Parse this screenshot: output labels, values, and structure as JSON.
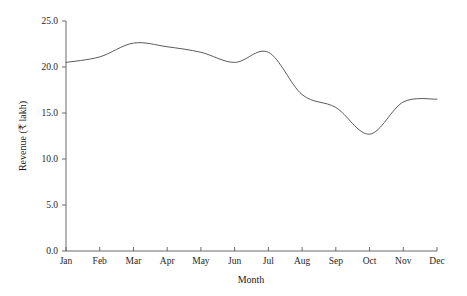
{
  "chart_data": {
    "type": "line",
    "title": "",
    "subtitle": "",
    "xlabel": "Month",
    "ylabel": "Revenue (₹ lakh)",
    "categories": [
      "Jan",
      "Feb",
      "Mar",
      "Apr",
      "May",
      "Jun",
      "Jul",
      "Aug",
      "Sep",
      "Oct",
      "Nov",
      "Dec"
    ],
    "values": [
      20.5,
      21.1,
      22.6,
      22.2,
      21.6,
      20.5,
      21.6,
      17.0,
      15.6,
      12.7,
      16.2,
      16.5
    ],
    "series": [
      {
        "name": "Revenue",
        "values": [
          20.5,
          21.1,
          22.6,
          22.2,
          21.6,
          20.5,
          21.6,
          17.0,
          15.6,
          12.7,
          16.2,
          16.5
        ],
        "color": "#5a5a5a"
      }
    ],
    "ylim": [
      0.0,
      25.0
    ],
    "ytick_values": [
      0.0,
      5.0,
      10.0,
      15.0,
      20.0,
      25.0
    ],
    "ytick_labels": [
      "0.0",
      "5.0",
      "10.0",
      "15.0",
      "20.0",
      "25.0"
    ],
    "xtick_labels": [
      "Jan",
      "Feb",
      "Mar",
      "Apr",
      "May",
      "Jun",
      "Jul",
      "Aug",
      "Sep",
      "Oct",
      "Nov",
      "Dec"
    ],
    "grid": false,
    "legend": false,
    "legend_position": "none",
    "smoothing": "spline",
    "line_color": "#5a5a5a",
    "axis_color": "#5a5a5a",
    "background_color": "#ffffff",
    "annotations": []
  }
}
